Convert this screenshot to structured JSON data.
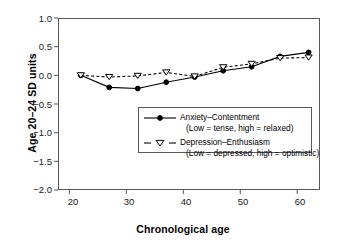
{
  "chart_data": {
    "type": "line",
    "title": "",
    "xlabel": "Chronological age",
    "ylabel": "Age 20–24 SD units",
    "xlim": [
      18,
      64
    ],
    "ylim": [
      -2.0,
      1.0
    ],
    "xticks": [
      20,
      30,
      40,
      50,
      60
    ],
    "xtick_labels": [
      "20",
      "30",
      "40",
      "50",
      "60"
    ],
    "yticks": [
      1.0,
      0.5,
      0.0,
      -0.5,
      -1.0,
      -1.5,
      -2.0
    ],
    "ytick_labels": [
      "1.0",
      "0.5",
      "0.0",
      "−0.5",
      "−1.0",
      "−1.5",
      "−2.0"
    ],
    "grid": false,
    "legend_position": "center",
    "x": [
      22,
      27,
      32,
      37,
      42,
      47,
      52,
      57,
      62
    ],
    "series": [
      {
        "name": "Anxiety–Contentment",
        "note": "(Low = tense, high = relaxed)",
        "marker": "filled-circle",
        "linestyle": "solid",
        "color": "#000000",
        "values": [
          0.0,
          -0.21,
          -0.23,
          -0.12,
          -0.03,
          0.08,
          0.15,
          0.33,
          0.4
        ]
      },
      {
        "name": "Depression–Enthusiasm",
        "note": "(Low = depressed, high = optimistic)",
        "marker": "open-down-triangle",
        "linestyle": "dashed",
        "color": "#000000",
        "values": [
          0.0,
          -0.03,
          -0.01,
          0.05,
          -0.02,
          0.14,
          0.2,
          0.3,
          0.31
        ]
      }
    ]
  },
  "legend": {
    "series1_label": "Anxiety–Contentment",
    "series1_sub": "(Low = tense, high = relaxed)",
    "series2_label": "Depression–Enthusiasm",
    "series2_sub": "(Low = depressed, high = optimistic)"
  }
}
